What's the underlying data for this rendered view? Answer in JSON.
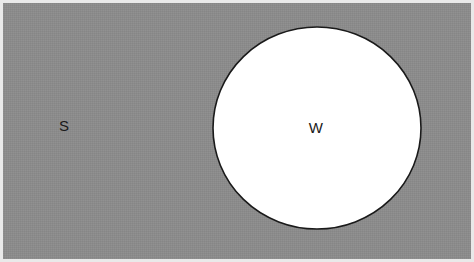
{
  "diagram": {
    "kind": "venn-set-diagram",
    "universal_set": {
      "label": "S",
      "label_x": 64,
      "label_y": 125,
      "fill_color": "#8c8c8c",
      "frame_color": "#e9e9e9",
      "x": 3,
      "y": 3,
      "width": 468,
      "height": 256
    },
    "subset": {
      "label": "W",
      "label_x": 316,
      "label_y": 127,
      "fill_color": "#ffffff",
      "stroke_color": "#1a1a1a",
      "stroke_width": 1.6,
      "center_x": 317,
      "center_y": 128,
      "radius_x": 104,
      "radius_y": 101
    },
    "label_color": "#1a1a1a",
    "canvas": {
      "width": 474,
      "height": 262
    }
  },
  "chart_data": {
    "type": "diagram",
    "title": "",
    "sets": [
      {
        "name": "S",
        "role": "universal-set",
        "shape": "rectangle",
        "fill": "#8c8c8c"
      },
      {
        "name": "W",
        "role": "subset",
        "shape": "circle",
        "fill": "#ffffff",
        "contained_in": "S"
      }
    ],
    "relations": [
      "W ⊂ S"
    ]
  }
}
